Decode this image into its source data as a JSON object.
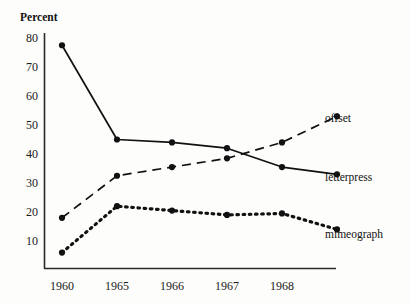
{
  "chart_data": {
    "type": "line",
    "title": "",
    "ylabel": "Percent",
    "xlabel": "",
    "grid": false,
    "legend_position": "right-inline",
    "ylim": [
      0,
      83
    ],
    "yticks": [
      10,
      20,
      30,
      40,
      50,
      60,
      70,
      80
    ],
    "categories": [
      "1960",
      "1965",
      "1966",
      "1967",
      "1968",
      ""
    ],
    "x": [
      1960,
      1965,
      1966,
      1967,
      1968,
      1969
    ],
    "series": [
      {
        "name": "letterpress",
        "style": "solid",
        "values": [
          77.5,
          45,
          44,
          42,
          35.5,
          33
        ]
      },
      {
        "name": "offset",
        "style": "dashed",
        "values": [
          18,
          32.5,
          35.5,
          38.5,
          44,
          53
        ]
      },
      {
        "name": "mimeograph",
        "style": "dotted",
        "values": [
          6,
          22,
          20.5,
          19,
          19.5,
          14
        ]
      }
    ]
  },
  "axis": {
    "y_title": "Percent",
    "y_tick_labels": [
      "80",
      "70",
      "60",
      "50",
      "40",
      "30",
      "20",
      "10"
    ],
    "x_tick_labels": [
      "1960",
      "1965",
      "1966",
      "1967",
      "1968"
    ]
  },
  "series_labels": {
    "offset": "offset",
    "letterpress": "letterpress",
    "mimeograph": "mimeograph"
  },
  "colors": {
    "ink": "#111111",
    "axis": "#2a2a2a",
    "background": "#fdfdfb"
  }
}
